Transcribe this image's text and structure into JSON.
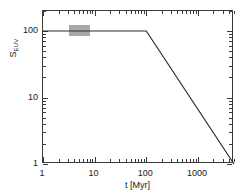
{
  "chart_data": {
    "type": "line",
    "title": "",
    "subtitle": "",
    "xlabel": "t [Myr]",
    "ylabel": "S_EUV",
    "ylabel_base": "S",
    "ylabel_sub": "EUV",
    "xscale": "log",
    "yscale": "log",
    "xlim": [
      1,
      5000
    ],
    "ylim": [
      1,
      200
    ],
    "xticklabels": [
      "1",
      "10",
      "100",
      "1000"
    ],
    "xtickvalues": [
      1,
      10,
      100,
      1000
    ],
    "yticklabels": [
      "1",
      "10",
      "100"
    ],
    "ytickvalues": [
      1,
      10,
      100
    ],
    "grid": false,
    "legend": null,
    "series": [
      {
        "name": "S_EUV(t)",
        "color": "#2b2b2b",
        "linewidth": 1.2,
        "x": [
          1,
          100,
          5000
        ],
        "y": [
          100,
          100,
          1
        ]
      }
    ],
    "annotations": [
      {
        "name": "shaded-band",
        "type": "rect",
        "color": "#a8a8a8",
        "x_range": [
          3.2,
          8.0
        ],
        "y_range": [
          83,
          125
        ],
        "label": ""
      }
    ]
  }
}
